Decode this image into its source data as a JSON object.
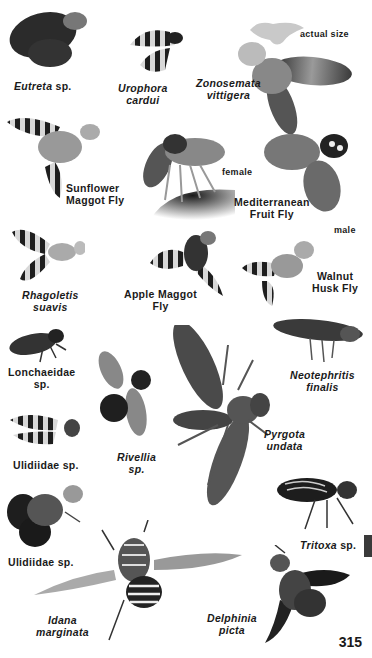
{
  "page": {
    "page_number": "315",
    "side_tab_color": "#3a3a3a",
    "actual_size_label": "actual size"
  },
  "species": [
    {
      "id": "eutreta",
      "name": "Eutreta",
      "suffix": " sp.",
      "italic": true
    },
    {
      "id": "urophora",
      "line1": "Urophora",
      "line2": "cardui",
      "italic": true
    },
    {
      "id": "zonosemata",
      "line1": "Zonosemata",
      "line2": "vittigera",
      "italic": true
    },
    {
      "id": "sunflower",
      "line1": "Sunflower",
      "line2": "Maggot Fly",
      "italic": false
    },
    {
      "id": "medfly",
      "line1": "Mediterranean",
      "line2": "Fruit Fly",
      "italic": false,
      "female_label": "female",
      "male_label": "male"
    },
    {
      "id": "rhagoletis",
      "line1": "Rhagoletis",
      "line2": "suavis",
      "italic": true
    },
    {
      "id": "apple",
      "line1": "Apple Maggot",
      "line2": "Fly",
      "italic": false
    },
    {
      "id": "walnut",
      "line1": "Walnut",
      "line2": "Husk Fly",
      "italic": false
    },
    {
      "id": "lonchaeidae",
      "line1": "Lonchaeidae",
      "line2": "sp.",
      "italic": false
    },
    {
      "id": "neotephritis",
      "line1": "Neotephritis",
      "line2": "finalis",
      "italic": true
    },
    {
      "id": "rivellia",
      "line1": "Rivellia",
      "line2": "sp.",
      "italic": true
    },
    {
      "id": "pyrgota",
      "line1": "Pyrgota",
      "line2": "undata",
      "italic": true
    },
    {
      "id": "ulidiidae1",
      "name": "Ulidiidae sp.",
      "italic": false
    },
    {
      "id": "tritoxa",
      "name": "Tritoxa",
      "suffix": " sp.",
      "italic": true
    },
    {
      "id": "ulidiidae2",
      "name": "Ulidiidae sp.",
      "italic": false
    },
    {
      "id": "idana",
      "line1": "Idana",
      "line2": "marginata",
      "italic": true
    },
    {
      "id": "delphinia",
      "line1": "Delphinia",
      "line2": "picta",
      "italic": true
    }
  ]
}
